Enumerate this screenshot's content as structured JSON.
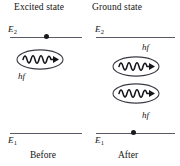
{
  "figure": {
    "type": "energy-level-diagram",
    "topic": "stimulated emission",
    "width": 180,
    "height": 166,
    "background_color": "#ffffff",
    "line_color": "#5a5a66",
    "text_color": "#141414"
  },
  "headers": {
    "left": "Excited state",
    "right": "Ground state"
  },
  "panels": {
    "before": {
      "caption": "Before",
      "upper_level_label": "E",
      "upper_level_sub": "2",
      "lower_level_label": "E",
      "lower_level_sub": "1",
      "electron_on": "upper",
      "photon_count": 1,
      "photon_labels": [
        "hf"
      ]
    },
    "after": {
      "caption": "After",
      "upper_level_label": "E",
      "upper_level_sub": "2",
      "lower_level_label": "E",
      "lower_level_sub": "1",
      "electron_on": "lower",
      "photon_count": 2,
      "photon_labels": [
        "hf",
        "hf"
      ]
    }
  },
  "icons": {
    "photon": "photon-wave-packet-icon",
    "electron": "electron-dot-icon"
  }
}
